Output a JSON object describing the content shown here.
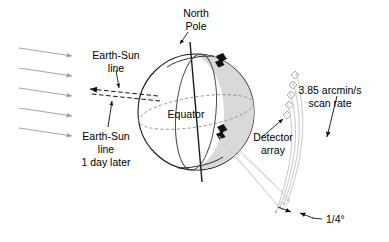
{
  "figure": {
    "kind": "scientific-diagram",
    "background_color": "#ffffff"
  },
  "colors": {
    "outline": "#1a1a1a",
    "sun_ray": "#9a9a9a",
    "terminator_shade": "#d9d9d9",
    "orbit_line": "#4a4a4a",
    "equator_dash": "#8a8a8a",
    "scan_arc": "#c8c8c8",
    "detector_outline": "#b0b0b0",
    "satellite_body": "#111111",
    "text": "#000000"
  },
  "labels": {
    "north_pole": {
      "line1": "North",
      "line2": "Pole"
    },
    "earth_sun_line": {
      "line1": "Earth-Sun",
      "line2": "line"
    },
    "earth_sun_line_later": {
      "line1": "Earth-Sun",
      "line2": "line",
      "line3": "1 day later"
    },
    "equator": "Equator",
    "scan_rate": {
      "line1": "3.85 arcmin/s",
      "line2": "scan rate"
    },
    "detector_array": {
      "line1": "Detector",
      "line2": "array"
    },
    "field_of_view": "1/4°"
  },
  "values": {
    "scan_rate_number": "3.85",
    "scan_rate_units": "arcmin/s",
    "field_of_view_angle": "1/4°",
    "sun_ray_count": 5,
    "detector_element_count": 5,
    "scan_arc_count": 4,
    "satellite_count": 2
  },
  "icons": {
    "sun_ray": "arrow-right-icon",
    "earth_sun_arrow": "arrow-left-icon",
    "scan_rate_arrow": "arrow-down-icon",
    "fov_arrow_left": "arrow-right-small-icon",
    "fov_arrow_right": "arrow-left-small-icon",
    "satellite": "satellite-icon",
    "detector": "diamond-icon"
  }
}
